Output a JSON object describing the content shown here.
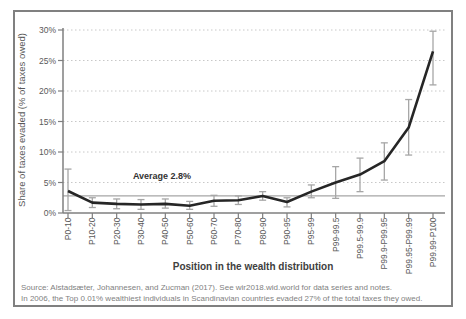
{
  "colors": {
    "frame_border": "#808080",
    "axis": "#7f7f7f",
    "gridline": "#c8c8c8",
    "average_line": "#a6a6a6",
    "data_line": "#262626",
    "error_bar": "#a6a6a6",
    "tick_text": "#595959",
    "source_text": "#7f7f7f"
  },
  "chart_data": {
    "type": "line",
    "title": "",
    "xlabel": "Position in the wealth distribution",
    "ylabel": "Share of taxes evaded (% of taxes owed)",
    "ylim": [
      0,
      30
    ],
    "yticks": [
      0,
      5,
      10,
      15,
      20,
      25,
      30
    ],
    "ytick_labels": [
      "0%",
      "5%",
      "10%",
      "15%",
      "20%",
      "25%",
      "30%"
    ],
    "grid": "horizontal-dotted",
    "legend": "none",
    "categories": [
      "P0-10",
      "P10-20",
      "P20-30",
      "P30-40",
      "P40-50",
      "P50-60",
      "P60-70",
      "P70-80",
      "P80-90",
      "P90-95",
      "P95-99",
      "P99-99.5",
      "P99.5-99.9",
      "P99.9-P99.95",
      "P99.95-P99.99",
      "P99.99-P100"
    ],
    "series": [
      {
        "name": "Share of taxes evaded (% of taxes owed)",
        "values": [
          3.6,
          1.7,
          1.5,
          1.4,
          1.5,
          1.2,
          2.0,
          2.1,
          2.8,
          1.8,
          3.5,
          5.0,
          6.3,
          8.5,
          14.0,
          26.5
        ],
        "ci_low": [
          0.4,
          0.9,
          0.7,
          0.6,
          0.8,
          0.6,
          1.1,
          1.4,
          2.1,
          1.0,
          2.5,
          2.4,
          3.5,
          5.4,
          9.5,
          21.0
        ],
        "ci_high": [
          7.2,
          2.5,
          2.3,
          2.2,
          2.3,
          1.9,
          2.9,
          2.8,
          3.5,
          2.5,
          4.6,
          7.6,
          9.0,
          11.5,
          18.6,
          29.8
        ]
      }
    ],
    "average_line": {
      "value": 2.8,
      "label": "Average 2.8%"
    }
  },
  "source": {
    "line1": "Source:  Alstadsæter, Johannesen, and Zucman (2017). See wir2018.wid.world for data series and notes.",
    "line2": "In 2006, the Top 0.01% wealthiest individuals in Scandinavian countries evaded 27% of the total taxes they owed."
  }
}
